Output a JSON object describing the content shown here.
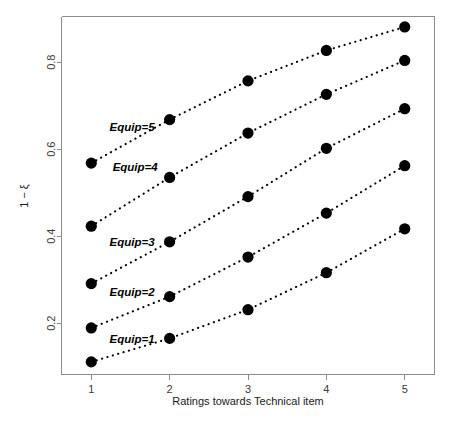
{
  "chart_data": {
    "type": "scatter",
    "title": "",
    "xlabel": "Ratings towards Technical item",
    "ylabel": "1 − ξ",
    "x": [
      1,
      2,
      3,
      4,
      5
    ],
    "xlim": [
      0.62,
      5.38
    ],
    "ylim": [
      0.082,
      0.905
    ],
    "xticks": [
      "1",
      "2",
      "3",
      "4",
      "5"
    ],
    "yticks": [
      "0.2",
      "0.4",
      "0.6",
      "0.8"
    ],
    "ytick_values": [
      0.2,
      0.4,
      0.6,
      0.8
    ],
    "grid": false,
    "legend": "inline-labels",
    "marker": "filled-circle",
    "line_style": "dotted",
    "series": [
      {
        "name": "Equip=5",
        "label": "Equip=5",
        "values": [
          0.568,
          0.668,
          0.757,
          0.827,
          0.881
        ],
        "label_x": 1.52,
        "label_y": 0.651
      },
      {
        "name": "Equip=4",
        "label": "Equip=4",
        "values": [
          0.423,
          0.535,
          0.637,
          0.726,
          0.804
        ],
        "label_x": 1.56,
        "label_y": 0.558
      },
      {
        "name": "Equip=3",
        "label": "Equip=3",
        "values": [
          0.291,
          0.387,
          0.491,
          0.602,
          0.693
        ],
        "label_x": 1.52,
        "label_y": 0.386
      },
      {
        "name": "Equip=2",
        "label": "Equip=2",
        "values": [
          0.189,
          0.261,
          0.352,
          0.453,
          0.562
        ],
        "label_x": 1.52,
        "label_y": 0.272
      },
      {
        "name": "Equip=1",
        "label": "Equip=1",
        "values": [
          0.111,
          0.165,
          0.231,
          0.316,
          0.417
        ],
        "label_x": 1.52,
        "label_y": 0.163
      }
    ]
  },
  "colors": {
    "point": "#000000",
    "line": "#000000",
    "axis": "#8c8c8c",
    "text": "#1a1a1a",
    "background": "#ffffff"
  }
}
